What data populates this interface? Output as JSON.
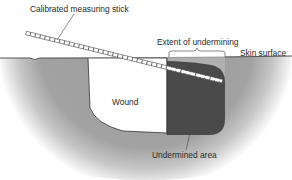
{
  "diagram": {
    "labels": {
      "stick": "Calibrated measuring stick",
      "extent": "Extent of undermining",
      "skin": "Skin surface",
      "wound": "Wound",
      "undermined": "Undermined area"
    },
    "colors": {
      "tissue": "#9a9a9a",
      "tissue_light": "#b4b4b4",
      "wound": "#ffffff",
      "undermined": "#4a4a4a",
      "skin_line": "#555555",
      "text": "#2a2a2a"
    }
  }
}
